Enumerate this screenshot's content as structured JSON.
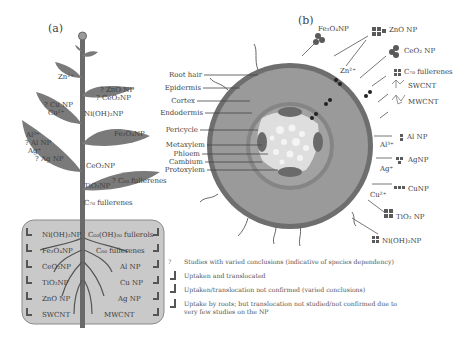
{
  "panels": {
    "a": {
      "label": "(a)"
    },
    "b": {
      "label": "(b)"
    }
  },
  "colors": {
    "leaf": "#7a7a7a",
    "stem": "#6a6a6a",
    "root_box": "#c9c9c9",
    "cortex": "#9a9a9a",
    "epidermis_ring": "#6e6e6e",
    "stele": "#d8d8d8",
    "text": "#3d3d3d"
  },
  "plant": {
    "leaf_labels": [
      {
        "text": "Zn²⁺"
      },
      {
        "text": "? ZnO NP"
      },
      {
        "text": "? CeO₂NP"
      },
      {
        "text": "? Cu NP"
      },
      {
        "text": "Cu²⁺"
      },
      {
        "text": "Ni(OH)₂NP"
      },
      {
        "text": "Al³⁺"
      },
      {
        "text": "? Al NP"
      },
      {
        "text": "Ag⁺"
      },
      {
        "text": "? Ag NP"
      },
      {
        "text": "Fe₃O₄NP"
      },
      {
        "text": "CeO₂NP"
      },
      {
        "text": "? C₆₀ fullerenes"
      },
      {
        "text": "TiO₂NP"
      },
      {
        "text": "C₇₀ fullerenes"
      }
    ],
    "root_labels_left": [
      "Ni(OH)₂NP",
      "Fe₃O₄NP",
      "CeO₂NP",
      "TiO₂NP",
      "ZnO NP",
      "SWCNT"
    ],
    "root_labels_right": [
      "C₆₀(OH)₂₀ fullerols",
      "C₆₀ fullerenes",
      "Al NP",
      "Cu NP",
      "Ag NP",
      "MWCNT"
    ]
  },
  "cross_section": {
    "tissue_labels": [
      "Root hair",
      "Epidermis",
      "Cortex",
      "Endodermis",
      "Pericycle",
      "Metaxylem",
      "Phloem",
      "Cambium",
      "Protoxylem"
    ],
    "np_labels": [
      {
        "text": "Fe₃O₄NP"
      },
      {
        "text": "ZnO NP"
      },
      {
        "text": "CeO₂ NP"
      },
      {
        "text": "Zn²⁺"
      },
      {
        "text": "C₇₀ fullerenes"
      },
      {
        "text": "SWCNT"
      },
      {
        "text": "MWCNT"
      },
      {
        "text": "Al NP"
      },
      {
        "text": "Al³⁺"
      },
      {
        "text": "AgNP"
      },
      {
        "text": "Ag⁺"
      },
      {
        "text": "CuNP"
      },
      {
        "text": "Cu²⁺"
      },
      {
        "text": "TiO₂ NP"
      },
      {
        "text": "Ni(OH)₂NP"
      }
    ]
  },
  "legend": {
    "items": [
      {
        "icon": "question-mark",
        "text": "Studies with varied conclusions (indicative of species dependency)"
      },
      {
        "icon": "arrow-up-translocated",
        "text": "Uptaken and translocated"
      },
      {
        "icon": "arrow-up-not-confirmed",
        "text": "Uptaken/translocation not confirmed (varied conclusions)"
      },
      {
        "icon": "arrow-up-roots-only",
        "text": "Uptake by roots; but translocation not studied/not confirmed due to",
        "text2": "very few studies on the NP"
      }
    ]
  }
}
